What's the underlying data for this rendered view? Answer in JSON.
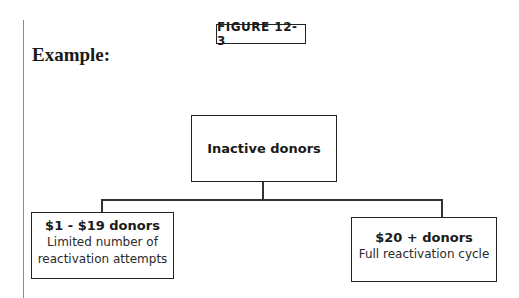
{
  "figure_label": "FIGURE 12-3",
  "heading": "Example:",
  "diagram": {
    "root": {
      "title": "Inactive donors"
    },
    "children": [
      {
        "title": "$1 - $19 donors",
        "subtitle_lines": [
          "Limited number of",
          "reactivation attempts"
        ]
      },
      {
        "title": "$20 + donors",
        "subtitle_lines": [
          "Full reactivation cycle"
        ]
      }
    ]
  }
}
